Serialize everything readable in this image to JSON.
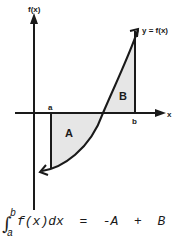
{
  "diagram": {
    "y_axis_label": "f(x)",
    "x_axis_label": "x",
    "curve_label": "y = f(x)",
    "lower_limit_label": "a",
    "upper_limit_label": "b",
    "region_below_label": "A",
    "region_above_label": "B",
    "shading_color": "#e6e6e6",
    "line_color": "#1a1a1a"
  },
  "formula": {
    "integral_sign": "∫",
    "upper_limit": "b",
    "lower_limit": "a",
    "expression": "f(x)dx  =  -A  +  B"
  }
}
